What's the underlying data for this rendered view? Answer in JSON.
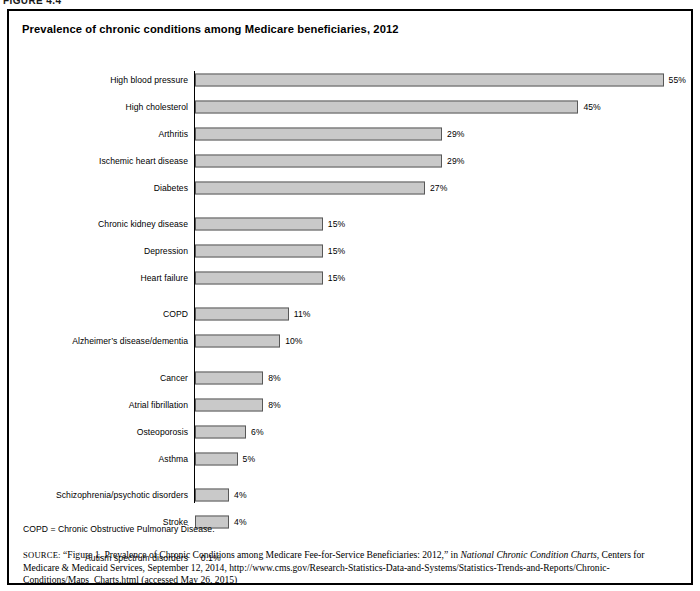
{
  "figure": {
    "number_label": "FIGURE 4.4",
    "title": "Prevalence of chronic conditions among Medicare beneficiaries, 2012",
    "footnote": "COPD = Chronic Obstructive Pulmonary Disease."
  },
  "source": {
    "label": "SOURCE:",
    "text_part1": "“Figure 1. Prevalence of Chronic Conditions among Medicare Fee-for-Service Beneficiaries: 2012,” in ",
    "italic_title": "National Chronic Condition Charts",
    "text_part2": ", Centers for Medicare & Medicaid Services, September 12, 2014, http://www.cms.gov/Research-Statistics-Data-and-Systems/Statistics-Trends-and-Reports/Chronic-Conditions/Maps_Charts.html (accessed May 26, 2015)"
  },
  "chart_data": {
    "type": "bar",
    "orientation": "horizontal",
    "title": "Prevalence of chronic conditions among Medicare beneficiaries, 2012",
    "xlabel": "",
    "ylabel": "",
    "xlim": [
      0,
      60
    ],
    "grid": false,
    "legend": "none",
    "value_suffix": "%",
    "categories": [
      "High blood pressure",
      "High cholesterol",
      "Arthritis",
      "Ischemic heart disease",
      "Diabetes",
      "Chronic kidney disease",
      "Depression",
      "Heart failure",
      "COPD",
      "Alzheimer’s disease/dementia",
      "Cancer",
      "Atrial fibrillation",
      "Osteoporosis",
      "Asthma",
      "Schizophrenia/psychotic disorders",
      "Stroke",
      "Autism spectrum disorders"
    ],
    "values": [
      55,
      45,
      29,
      29,
      27,
      15,
      15,
      15,
      11,
      10,
      8,
      8,
      6,
      5,
      4,
      4,
      0.1
    ],
    "value_labels": [
      "55%",
      "45%",
      "29%",
      "29%",
      "27%",
      "15%",
      "15%",
      "15%",
      "11%",
      "10%",
      "8%",
      "8%",
      "6%",
      "5%",
      "4%",
      "4%",
      "0.1%"
    ],
    "colors": {
      "bar_fill": "#c9c9c9",
      "bar_border": "#585858",
      "axis": "#000000",
      "text": "#000000",
      "frame": "#000000",
      "background": "#ffffff"
    }
  }
}
